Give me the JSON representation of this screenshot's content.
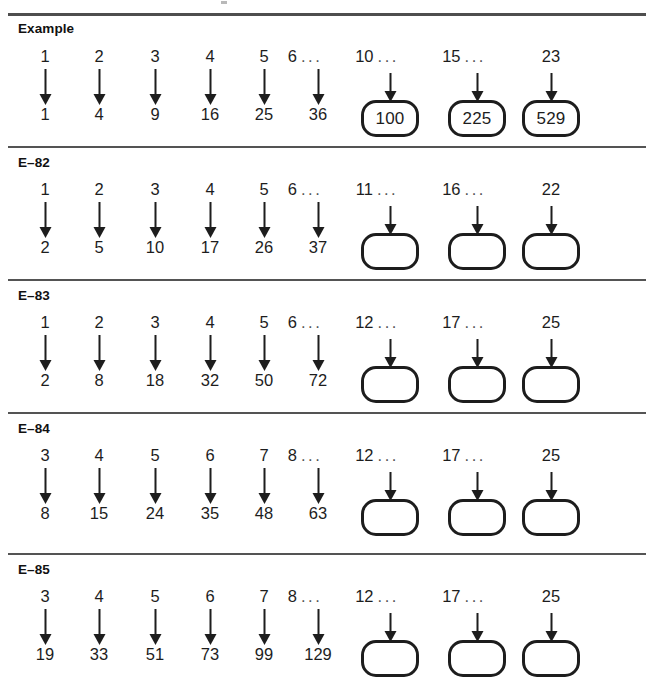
{
  "document": {
    "type": "math-worksheet",
    "description": "Function machine tables: inputs with arrows to outputs, blank rounded answer boxes"
  },
  "sections": [
    {
      "label": "Example",
      "columns": [
        {
          "input": "1",
          "ellipsis": false,
          "output": "1",
          "boxed": false
        },
        {
          "input": "2",
          "ellipsis": false,
          "output": "4",
          "boxed": false
        },
        {
          "input": "3",
          "ellipsis": false,
          "output": "9",
          "boxed": false
        },
        {
          "input": "4",
          "ellipsis": false,
          "output": "16",
          "boxed": false
        },
        {
          "input": "5",
          "ellipsis": false,
          "output": "25",
          "boxed": false
        },
        {
          "input": "6",
          "ellipsis": true,
          "output": "36",
          "boxed": false
        },
        {
          "input": "10",
          "ellipsis": true,
          "output": "100",
          "boxed": true
        },
        {
          "input": "15",
          "ellipsis": true,
          "output": "225",
          "boxed": true
        },
        {
          "input": "23",
          "ellipsis": false,
          "output": "529",
          "boxed": true
        }
      ]
    },
    {
      "label": "E–82",
      "columns": [
        {
          "input": "1",
          "ellipsis": false,
          "output": "2",
          "boxed": false
        },
        {
          "input": "2",
          "ellipsis": false,
          "output": "5",
          "boxed": false
        },
        {
          "input": "3",
          "ellipsis": false,
          "output": "10",
          "boxed": false
        },
        {
          "input": "4",
          "ellipsis": false,
          "output": "17",
          "boxed": false
        },
        {
          "input": "5",
          "ellipsis": false,
          "output": "26",
          "boxed": false
        },
        {
          "input": "6",
          "ellipsis": true,
          "output": "37",
          "boxed": false
        },
        {
          "input": "11",
          "ellipsis": true,
          "output": "",
          "boxed": true
        },
        {
          "input": "16",
          "ellipsis": true,
          "output": "",
          "boxed": true
        },
        {
          "input": "22",
          "ellipsis": false,
          "output": "",
          "boxed": true
        }
      ]
    },
    {
      "label": "E–83",
      "columns": [
        {
          "input": "1",
          "ellipsis": false,
          "output": "2",
          "boxed": false
        },
        {
          "input": "2",
          "ellipsis": false,
          "output": "8",
          "boxed": false
        },
        {
          "input": "3",
          "ellipsis": false,
          "output": "18",
          "boxed": false
        },
        {
          "input": "4",
          "ellipsis": false,
          "output": "32",
          "boxed": false
        },
        {
          "input": "5",
          "ellipsis": false,
          "output": "50",
          "boxed": false
        },
        {
          "input": "6",
          "ellipsis": true,
          "output": "72",
          "boxed": false
        },
        {
          "input": "12",
          "ellipsis": true,
          "output": "",
          "boxed": true
        },
        {
          "input": "17",
          "ellipsis": true,
          "output": "",
          "boxed": true
        },
        {
          "input": "25",
          "ellipsis": false,
          "output": "",
          "boxed": true
        }
      ]
    },
    {
      "label": "E–84",
      "columns": [
        {
          "input": "3",
          "ellipsis": false,
          "output": "8",
          "boxed": false
        },
        {
          "input": "4",
          "ellipsis": false,
          "output": "15",
          "boxed": false
        },
        {
          "input": "5",
          "ellipsis": false,
          "output": "24",
          "boxed": false
        },
        {
          "input": "6",
          "ellipsis": false,
          "output": "35",
          "boxed": false
        },
        {
          "input": "7",
          "ellipsis": false,
          "output": "48",
          "boxed": false
        },
        {
          "input": "8",
          "ellipsis": true,
          "output": "63",
          "boxed": false
        },
        {
          "input": "12",
          "ellipsis": true,
          "output": "",
          "boxed": true
        },
        {
          "input": "17",
          "ellipsis": true,
          "output": "",
          "boxed": true
        },
        {
          "input": "25",
          "ellipsis": false,
          "output": "",
          "boxed": true
        }
      ]
    },
    {
      "label": "E–85",
      "columns": [
        {
          "input": "3",
          "ellipsis": false,
          "output": "19",
          "boxed": false
        },
        {
          "input": "4",
          "ellipsis": false,
          "output": "33",
          "boxed": false
        },
        {
          "input": "5",
          "ellipsis": false,
          "output": "51",
          "boxed": false
        },
        {
          "input": "6",
          "ellipsis": false,
          "output": "73",
          "boxed": false
        },
        {
          "input": "7",
          "ellipsis": false,
          "output": "99",
          "boxed": false
        },
        {
          "input": "8",
          "ellipsis": true,
          "output": "129",
          "boxed": false
        },
        {
          "input": "12",
          "ellipsis": true,
          "output": "",
          "boxed": true
        },
        {
          "input": "17",
          "ellipsis": true,
          "output": "",
          "boxed": true
        },
        {
          "input": "25",
          "ellipsis": false,
          "output": "",
          "boxed": true
        }
      ]
    }
  ],
  "ellipsis_glyph": "...",
  "colors": {
    "ink": "#1d1d1d",
    "rule": "#4e4e4e",
    "page": "#ffffff"
  }
}
